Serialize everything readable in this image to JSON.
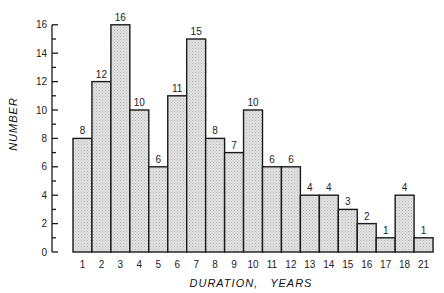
{
  "chart_data": {
    "type": "bar",
    "title": "",
    "xlabel": "DURATION,   YEARS",
    "ylabel": "NUMBER",
    "categories": [
      "1",
      "2",
      "3",
      "4",
      "5",
      "6",
      "7",
      "8",
      "9",
      "10",
      "11",
      "12",
      "13",
      "14",
      "15",
      "16",
      "17",
      "18",
      "21"
    ],
    "values": [
      8,
      12,
      16,
      10,
      6,
      11,
      15,
      8,
      7,
      10,
      6,
      6,
      4,
      4,
      3,
      2,
      1,
      4,
      1
    ],
    "data_labels": [
      "8",
      "12",
      "16",
      "10",
      "6",
      "11",
      "15",
      "8",
      "7",
      "10",
      "6",
      "6",
      "4",
      "4",
      "3",
      "2",
      "1",
      "4",
      "1"
    ],
    "ylim": [
      0,
      16
    ],
    "yticks": [
      0,
      2,
      4,
      6,
      8,
      10,
      12,
      14,
      16
    ],
    "minor_yticks": [
      1,
      3,
      5,
      7,
      9,
      11,
      13,
      15
    ],
    "grid": false,
    "legend": null,
    "bar_fill": "#d9d9d9",
    "bar_stroke": "#1a1a1a"
  }
}
